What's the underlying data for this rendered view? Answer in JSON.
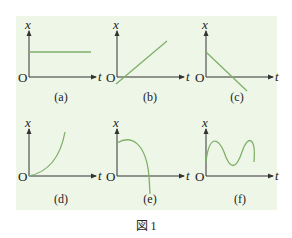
{
  "figure": {
    "caption": "図 1",
    "background_color": "#eef6e8",
    "curve_color": "#7fb069",
    "axis_color": "#333333",
    "panels": [
      {
        "id": "a",
        "label": "(a)",
        "x_axis": "t",
        "y_axis": "x",
        "origin": "O",
        "curve": "constant (horizontal line, positive x)"
      },
      {
        "id": "b",
        "label": "(b)",
        "x_axis": "t",
        "y_axis": "x",
        "origin": "O",
        "curve": "linear increasing from origin"
      },
      {
        "id": "c",
        "label": "(c)",
        "x_axis": "t",
        "y_axis": "x",
        "origin": "O",
        "curve": "linear decreasing, crosses t-axis"
      },
      {
        "id": "d",
        "label": "(d)",
        "x_axis": "t",
        "y_axis": "x",
        "origin": "O",
        "curve": "increasing, concave up from origin"
      },
      {
        "id": "e",
        "label": "(e)",
        "x_axis": "t",
        "y_axis": "x",
        "origin": "O",
        "curve": "decreasing, concave down, crosses t-axis"
      },
      {
        "id": "f",
        "label": "(f)",
        "x_axis": "t",
        "y_axis": "x",
        "origin": "O",
        "curve": "oscillating (sinusoidal)"
      }
    ]
  }
}
